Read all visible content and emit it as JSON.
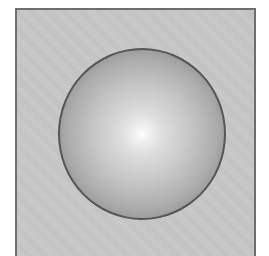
{
  "figure": {
    "background_color": "#c8c8c8",
    "border_color": "#6e6e6e",
    "sphere": {
      "shape": "sphere",
      "highlight_color": "#ffffff",
      "shade_color": "#9a9a9a",
      "outline_color": "#555555"
    }
  }
}
